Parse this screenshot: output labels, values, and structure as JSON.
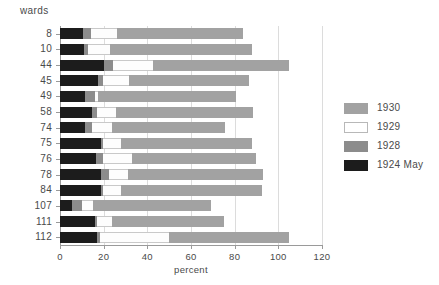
{
  "chart_data": {
    "type": "bar",
    "orientation": "horizontal",
    "stacked": true,
    "title": "",
    "xlabel": "percent",
    "ylabel": "wards",
    "xlim": [
      0,
      120
    ],
    "xticks": [
      0,
      20,
      40,
      60,
      80,
      100,
      120
    ],
    "grid": true,
    "legend_position": "right",
    "categories": [
      "8",
      "10",
      "44",
      "45",
      "49",
      "58",
      "74",
      "75",
      "76",
      "78",
      "84",
      "107",
      "111",
      "112"
    ],
    "series": [
      {
        "name": "1924 May",
        "color": "#1c1c1c",
        "values": [
          10.5,
          11.0,
          20.0,
          17.5,
          11.5,
          14.5,
          11.5,
          19.0,
          16.5,
          19.0,
          19.0,
          5.5,
          16.0,
          17.0
        ]
      },
      {
        "name": "1928",
        "color": "#8c8c8c",
        "values": [
          3.5,
          2.0,
          4.5,
          2.0,
          4.5,
          2.5,
          3.0,
          0.5,
          3.0,
          3.5,
          0.5,
          4.5,
          1.0,
          1.5
        ]
      },
      {
        "name": "1929",
        "color": "#ffffff",
        "values": [
          12.0,
          10.0,
          18.0,
          12.0,
          1.5,
          8.5,
          9.5,
          8.5,
          13.5,
          8.5,
          8.5,
          5.0,
          7.0,
          31.5
        ]
      },
      {
        "name": "1930",
        "color": "#a2a2a2",
        "values": [
          58.0,
          65.0,
          62.5,
          55.0,
          63.0,
          63.0,
          51.5,
          60.0,
          57.0,
          62.0,
          64.5,
          54.0,
          51.0,
          55.0
        ]
      }
    ],
    "totals": [
      84.0,
      88.0,
      105.0,
      86.5,
      80.5,
      88.5,
      75.5,
      88.0,
      90.0,
      93.0,
      92.5,
      69.0,
      75.0,
      105.0
    ],
    "legend_entries": [
      {
        "label": "1930",
        "color": "#a2a2a2"
      },
      {
        "label": "1929",
        "color": "#ffffff"
      },
      {
        "label": "1928",
        "color": "#8c8c8c"
      },
      {
        "label": "1924 May",
        "color": "#1c1c1c"
      }
    ]
  }
}
